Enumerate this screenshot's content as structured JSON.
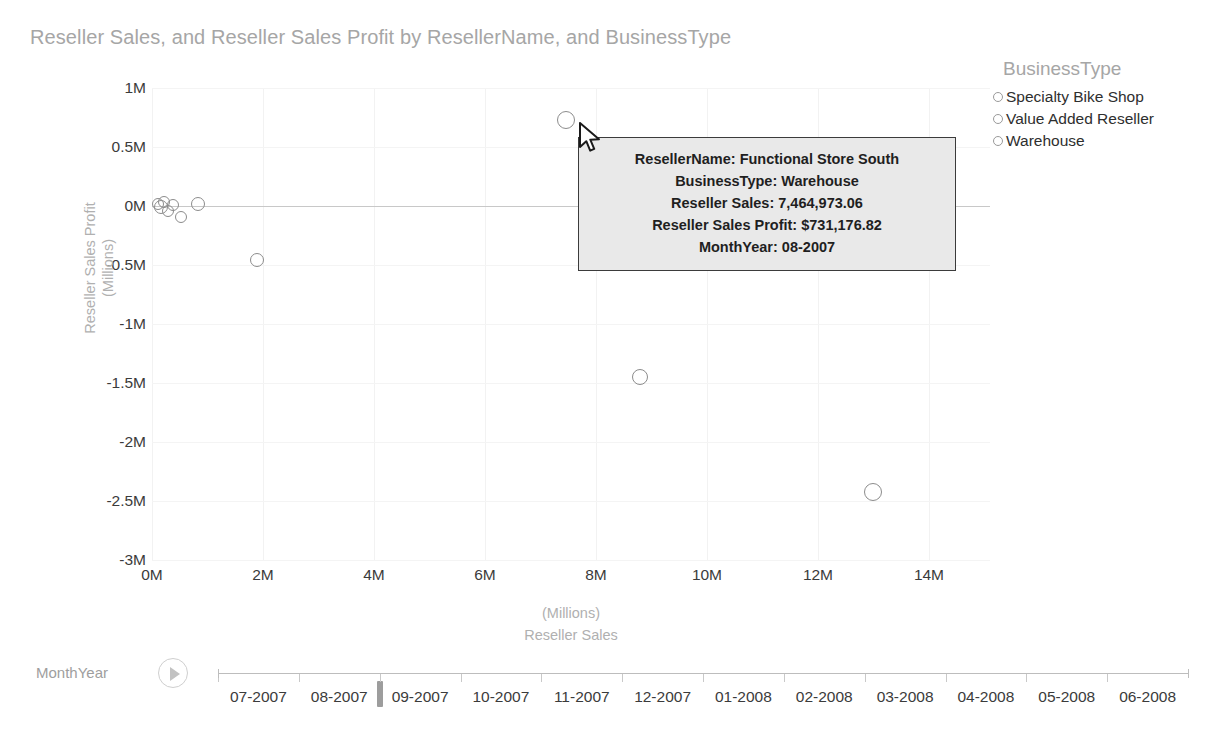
{
  "chart_data": {
    "type": "scatter",
    "title": "Reseller Sales, and Reseller Sales Profit by ResellerName, and BusinessType",
    "xlabel": "Reseller Sales",
    "xunit": "(Millions)",
    "ylabel": "Reseller Sales Profit",
    "yunit": "(Millions)",
    "xlim": [
      0,
      15.1
    ],
    "ylim": [
      -3,
      1
    ],
    "xticks": [
      "0M",
      "2M",
      "4M",
      "6M",
      "8M",
      "10M",
      "12M",
      "14M"
    ],
    "xtick_values": [
      0,
      2,
      4,
      6,
      8,
      10,
      12,
      14
    ],
    "yticks": [
      "1M",
      "0.5M",
      "0M",
      "-0.5M",
      "-1M",
      "-1.5M",
      "-2M",
      "-2.5M",
      "-3M"
    ],
    "ytick_values": [
      1,
      0.5,
      0,
      -0.5,
      -1,
      -1.5,
      -2,
      -2.5,
      -3
    ],
    "grid": true,
    "legend_position": "right",
    "legend_title": "BusinessType",
    "series": [
      {
        "name": "Specialty Bike Shop",
        "points": []
      },
      {
        "name": "Value Added Reseller",
        "points": []
      },
      {
        "name": "Warehouse",
        "points": []
      }
    ],
    "points": [
      {
        "x": 0.1,
        "y": 0.02,
        "r": 6
      },
      {
        "x": 0.16,
        "y": -0.01,
        "r": 7
      },
      {
        "x": 0.22,
        "y": 0.03,
        "r": 6
      },
      {
        "x": 0.28,
        "y": -0.04,
        "r": 6
      },
      {
        "x": 0.38,
        "y": 0.01,
        "r": 6
      },
      {
        "x": 0.52,
        "y": -0.09,
        "r": 6
      },
      {
        "x": 0.82,
        "y": 0.02,
        "r": 7
      },
      {
        "x": 1.9,
        "y": -0.46,
        "r": 7
      },
      {
        "x": 7.46,
        "y": 0.73,
        "r": 9
      },
      {
        "x": 8.8,
        "y": -1.45,
        "r": 8
      },
      {
        "x": 13.0,
        "y": -2.42,
        "r": 9
      }
    ]
  },
  "legend": {
    "title": "BusinessType",
    "items": [
      {
        "label": "Specialty Bike Shop"
      },
      {
        "label": "Value Added Reseller"
      },
      {
        "label": "Warehouse"
      }
    ]
  },
  "tooltip": {
    "rows": [
      "ResellerName: Functional Store South",
      "BusinessType: Warehouse",
      "Reseller Sales: 7,464,973.06",
      "Reseller Sales Profit: $731,176.82",
      "MonthYear: 08-2007"
    ]
  },
  "timeline": {
    "label": "MonthYear",
    "play_icon": "play-icon",
    "selected": "08-2007",
    "ticks": [
      "07-2007",
      "08-2007",
      "09-2007",
      "10-2007",
      "11-2007",
      "12-2007",
      "01-2008",
      "02-2008",
      "03-2008",
      "04-2008",
      "05-2008",
      "06-2008"
    ]
  },
  "colors": {
    "title": "#a6a6a6",
    "tick": "#3b3b3b",
    "axis_title": "#b0b0b0",
    "marker_stroke": "#8c8c8c",
    "grid": "#f2f2f2",
    "zero_line": "#c8c8c8",
    "tooltip_bg": "#e9e9e9",
    "tooltip_border": "#3b3b3b"
  }
}
